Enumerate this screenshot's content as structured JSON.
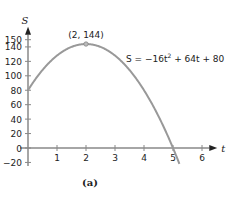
{
  "chart_data": {
    "type": "line",
    "title": "",
    "caption": "(a)",
    "xlabel": "t",
    "ylabel": "S",
    "xlim": [
      0,
      6.3
    ],
    "ylim": [
      -25,
      160
    ],
    "x_ticks": [
      1,
      2,
      3,
      4,
      5,
      6
    ],
    "x_tick_labels": [
      "1",
      "2",
      "3",
      "4",
      "5",
      "6"
    ],
    "y_ticks": [
      -20,
      0,
      20,
      40,
      60,
      80,
      100,
      120,
      140,
      150
    ],
    "y_tick_labels": [
      "−20",
      "0",
      "20",
      "40",
      "60",
      "80",
      "100",
      "120",
      "140",
      "150"
    ],
    "grid": false,
    "series": [
      {
        "name": "S = −16t² + 64t + 80",
        "equation": {
          "a": -16,
          "b": 64,
          "c": 80
        },
        "x": [
          0,
          0.5,
          1,
          1.5,
          2,
          2.5,
          3,
          3.5,
          4,
          4.5,
          5,
          5.2
        ],
        "values": [
          80,
          108,
          128,
          140,
          144,
          140,
          128,
          108,
          80,
          44,
          0,
          -19.84
        ],
        "color": "#999999"
      }
    ],
    "annotations": [
      {
        "text": "(2, 144)",
        "x": 2,
        "y": 144,
        "marker": true
      },
      {
        "text_parts": [
          "S = −16t",
          "2",
          " + 64t + 80"
        ],
        "position": "upper-right"
      }
    ]
  }
}
